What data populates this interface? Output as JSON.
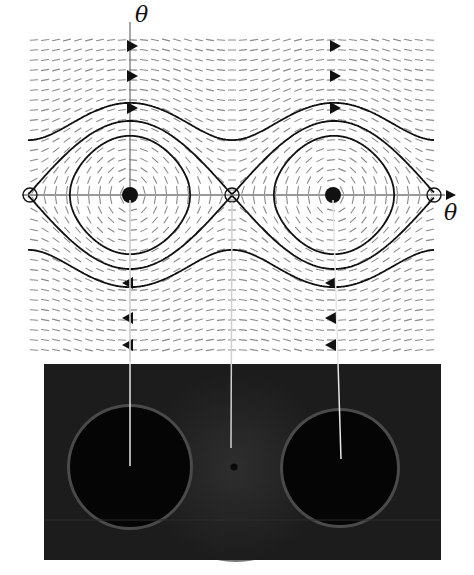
{
  "figure": {
    "axes": {
      "x_label": "θ",
      "y_label": "θ̇",
      "y_label_base": "θ",
      "y_label_dot": "˙"
    },
    "colors": {
      "background": "#ffffff",
      "curve": "#111111",
      "axis": "#777777",
      "vector_field": "#8a8a8a",
      "image_background": "#1c1c1c",
      "disc": "#050505",
      "disc_rim": "#4a4a4a",
      "guide_line": "#e6e6e6"
    },
    "fixed_points": [
      {
        "type": "saddle",
        "marker": "open-circle",
        "x_px": 30,
        "y_px": 195
      },
      {
        "type": "center",
        "marker": "filled-circle",
        "x_px": 130,
        "y_px": 195
      },
      {
        "type": "saddle",
        "marker": "open-circle",
        "x_px": 232,
        "y_px": 195
      },
      {
        "type": "center",
        "marker": "filled-circle",
        "x_px": 333,
        "y_px": 195
      },
      {
        "type": "saddle",
        "marker": "open-circle",
        "x_px": 434,
        "y_px": 195
      }
    ],
    "trajectories": {
      "libration_orbits": 1,
      "separatrix": 1,
      "rotation_orbits_above": 1,
      "rotation_orbits_below": 1,
      "arrow_rows_top_y_px": [
        46,
        76,
        108
      ],
      "arrow_rows_bottom_y_px": [
        283,
        318,
        345
      ],
      "top_arrow_direction": "right",
      "bottom_arrow_direction": "left"
    },
    "image_panel": {
      "description": "dark experimental image with two dark circular regions aligned to centers",
      "discs": [
        {
          "cx_px": 130,
          "cy_px": 467,
          "r_px": 60
        },
        {
          "cx_px": 340,
          "cy_px": 468,
          "r_px": 57
        }
      ],
      "central_dot": {
        "cx_px": 234,
        "cy_px": 467
      }
    }
  }
}
